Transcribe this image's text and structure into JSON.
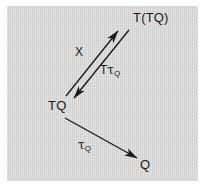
{
  "figure": {
    "kind": "commutative-diagram",
    "background_color": "#ffffff",
    "panel_color": "#d4d4d4",
    "ink_color": "#1a1a1a"
  },
  "nodes": [
    {
      "id": "ttq",
      "label": "T(TQ)",
      "x": 126,
      "y": 5
    },
    {
      "id": "tq",
      "label": "TQ",
      "x": 41,
      "y": 93
    },
    {
      "id": "q",
      "label": "Q",
      "x": 133,
      "y": 152
    }
  ],
  "edges": [
    {
      "id": "x",
      "label_plain": "X",
      "label_text": "X",
      "from": "tq",
      "to": "ttq",
      "direction": "up-right",
      "arrowhead": "end"
    },
    {
      "id": "t-tau-q",
      "label_plain": "TtauQ",
      "label_head": "T",
      "label_tau": "τ",
      "label_sub": "Q",
      "from": "ttq",
      "to": "tq",
      "direction": "down-left",
      "arrowhead": "end"
    },
    {
      "id": "tau-q",
      "label_plain": "tauQ",
      "label_head": "",
      "label_tau": "τ",
      "label_sub": "Q",
      "from": "tq",
      "to": "q",
      "direction": "down-right",
      "arrowhead": "end"
    }
  ],
  "labels": {
    "node_ttq": "T(TQ)",
    "node_tq": "TQ",
    "node_q": "Q",
    "edge_x": "X",
    "edge_t_prefix": "T",
    "tau_glyph": "τ",
    "subscript_q": "Q"
  }
}
